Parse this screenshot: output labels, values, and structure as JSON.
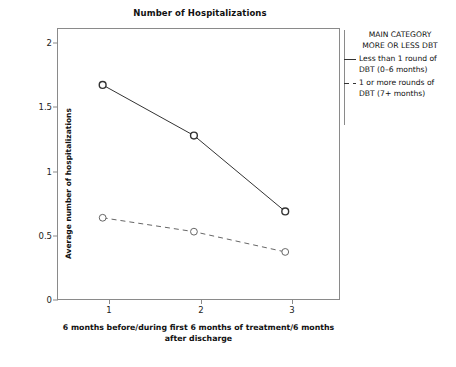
{
  "chart_data": {
    "type": "line",
    "title": "Number of Hospitalizations",
    "xlabel": "6 months before/during first 6 months of treatment/6 months after discharge",
    "ylabel": "Average number of hospitalizations",
    "categories": [
      "1",
      "2",
      "3"
    ],
    "x": [
      1,
      2,
      3
    ],
    "xlim": [
      0.5,
      3.6
    ],
    "ylim": [
      0,
      2.15
    ],
    "yticks": [
      "0",
      "0.5",
      "1",
      "1.5",
      "2"
    ],
    "ytick_values": [
      0,
      0.5,
      1,
      1.5,
      2
    ],
    "xticks": [
      "1",
      "2",
      "3"
    ],
    "grid": false,
    "legend_position": "right",
    "legend_title": "MAIN CATEGORY\nMORE OR LESS DBT",
    "series": [
      {
        "name": "Less than 1 round of DBT (0–6 months)",
        "values": [
          1.7,
          1.3,
          0.7
        ],
        "style": "solid",
        "marker": "open-circle",
        "color": "#333333"
      },
      {
        "name": "1 or more rounds of DBT (7+ months)",
        "values": [
          0.65,
          0.54,
          0.38
        ],
        "style": "dashed",
        "marker": "open-circle",
        "color": "#666666"
      }
    ]
  },
  "title": "Number of Hospitalizations",
  "axes": {
    "y_label": "Average number of hospitalizations",
    "x_caption_line1": "6 months before/during first 6 months of treatment/6 months",
    "x_caption_line2": "after discharge",
    "y_tick_0": "0",
    "y_tick_1": "0.5",
    "y_tick_2": "1",
    "y_tick_3": "1.5",
    "y_tick_4": "2",
    "x_tick_1": "1",
    "x_tick_2": "2",
    "x_tick_3": "3"
  },
  "legend": {
    "title_line1": "MAIN CATEGORY",
    "title_line2": "MORE OR LESS DBT",
    "entries": [
      {
        "label_line1": "Less than 1 round of",
        "label_line2": "DBT (0–6 months)"
      },
      {
        "label_line1": "1 or more rounds of",
        "label_line2": "DBT (7+ months)"
      }
    ]
  }
}
